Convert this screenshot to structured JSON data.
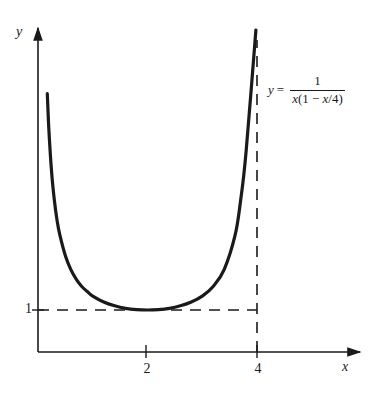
{
  "figure": {
    "background_color": "#ffffff",
    "ink_color": "#1a1a1a"
  },
  "axes": {
    "x_label": "x",
    "y_label": "y",
    "x_ticks": [
      {
        "value": 2,
        "label": "2"
      },
      {
        "value": 4,
        "label": "4"
      }
    ],
    "y_ticks": [
      {
        "value": 1,
        "label": "1"
      }
    ]
  },
  "annotation": {
    "lhs": "y",
    "equals": "=",
    "numerator": "1",
    "denominator_x": "x",
    "denominator_open": "(1 − ",
    "denominator_var": "x",
    "denominator_close": "/4)",
    "full_text": "y = 1 / (x(1 − x/4))"
  },
  "guides": {
    "horizontal_dashed_y": 1,
    "vertical_dashed_x": 4,
    "style": "dashed"
  },
  "chart_data": {
    "type": "line",
    "title": "",
    "xlabel": "x",
    "ylabel": "y",
    "xlim": [
      0,
      4.55
    ],
    "ylim": [
      0,
      6.1
    ],
    "grid": false,
    "legend": null,
    "function": "y = 1/(x(1 - x/4))",
    "asymptotes": {
      "vertical": [
        0,
        4
      ]
    },
    "minimum": {
      "x": 2,
      "y": 1
    },
    "xticks": [
      2,
      4
    ],
    "yticks": [
      1
    ],
    "series": [
      {
        "name": "y = 1/(x(1 - x/4))",
        "color": "#1a1a1a",
        "x": [
          0.17,
          0.2,
          0.25,
          0.3,
          0.35,
          0.4,
          0.5,
          0.6,
          0.7,
          0.8,
          0.9,
          1.0,
          1.2,
          1.4,
          1.6,
          1.8,
          2.0,
          2.2,
          2.4,
          2.6,
          2.8,
          3.0,
          3.2,
          3.4,
          3.6,
          3.7,
          3.8,
          3.9,
          3.95,
          3.98
        ],
        "y": [
          6.15,
          5.26,
          4.26,
          3.6,
          3.12,
          2.78,
          2.29,
          1.96,
          1.73,
          1.56,
          1.44,
          1.33,
          1.19,
          1.1,
          1.04,
          1.01,
          1.0,
          1.01,
          1.04,
          1.1,
          1.19,
          1.33,
          1.56,
          1.96,
          2.78,
          3.6,
          4.76,
          7.69,
          12.7,
          25.13
        ]
      }
    ]
  }
}
